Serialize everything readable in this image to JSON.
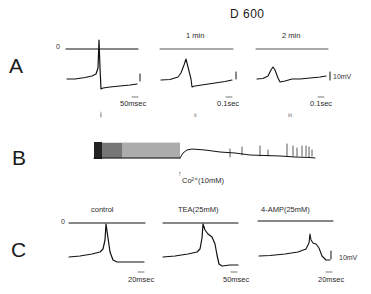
{
  "figure": {
    "title": "D 600",
    "panels": [
      {
        "label": "A",
        "zero_label": "0",
        "traces": [
          {
            "header": "",
            "time_scale": "50msec",
            "index": "i"
          },
          {
            "header": "1 min",
            "time_scale": "0.1sec",
            "index": "ii"
          },
          {
            "header": "2 min",
            "time_scale": "0.1sec",
            "index": "iii"
          }
        ],
        "voltage_scale": "10mV"
      },
      {
        "label": "B",
        "annotation": "Co²⁺(10mM)",
        "arrow": "↑"
      },
      {
        "label": "C",
        "zero_label": "0",
        "traces": [
          {
            "header": "control",
            "time_scale": "20msec"
          },
          {
            "header": "TEA(25mM)",
            "time_scale": "50msec"
          },
          {
            "header": "4-AMP(25mM)",
            "time_scale": "20msec"
          }
        ],
        "voltage_scale": "10mV"
      }
    ]
  }
}
